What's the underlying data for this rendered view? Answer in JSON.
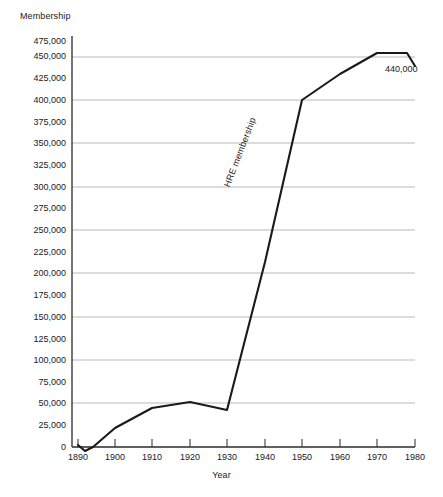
{
  "chart_data": {
    "type": "line",
    "title": "",
    "xlabel": "Year",
    "ylabel": "Membership",
    "xlim": [
      1890,
      1980
    ],
    "ylim": [
      0,
      475000
    ],
    "grid": "horizontal-only-at-50000-multiples",
    "legend": "none",
    "x_ticks": [
      1890,
      1900,
      1910,
      1920,
      1930,
      1940,
      1950,
      1960,
      1970,
      1980
    ],
    "y_ticks": [
      0,
      25000,
      50000,
      75000,
      100000,
      125000,
      150000,
      175000,
      200000,
      225000,
      250000,
      275000,
      300000,
      325000,
      350000,
      375000,
      400000,
      425000,
      450000,
      475000
    ],
    "y_tick_labels": [
      "0",
      "25,000",
      "50,000",
      "75,000",
      "100,000",
      "125,000",
      "150,000",
      "175,000",
      "200,000",
      "225,000",
      "250,000",
      "275,000",
      "300,000",
      "325,000",
      "350,000",
      "375,000",
      "400,000",
      "425,000",
      "450,000",
      "475,000"
    ],
    "x_tick_labels": [
      "1890",
      "1900",
      "1910",
      "1920",
      "1930",
      "1940",
      "1950",
      "1960",
      "1970",
      "1980"
    ],
    "gridline_values": [
      50000,
      100000,
      150000,
      200000,
      250000,
      300000,
      350000,
      400000,
      450000
    ],
    "series": [
      {
        "name": "HRE membership",
        "color": "#1a1a1a",
        "x": [
          1890,
          1893,
          1895,
          1900,
          1910,
          1920,
          1930,
          1940,
          1950,
          1960,
          1970,
          1978,
          1980
        ],
        "values": [
          2000,
          -6000,
          0,
          22000,
          45000,
          52000,
          43000,
          215000,
          400000,
          430000,
          455000,
          455000,
          440000
        ]
      }
    ],
    "annotations": [
      {
        "name": "end-value",
        "text": "440,000",
        "x": 1980,
        "y": 440000
      },
      {
        "name": "series-inline-label",
        "text": "HRE membership",
        "rotated": true
      }
    ]
  },
  "axes": {
    "y_title": "Membership",
    "x_title": "Year"
  },
  "colors": {
    "line": "#1a1a1a",
    "gridline": "#b9b9b9",
    "axis": "#2b2b2b",
    "background": "#ffffff",
    "text": "#1a1a1a"
  }
}
